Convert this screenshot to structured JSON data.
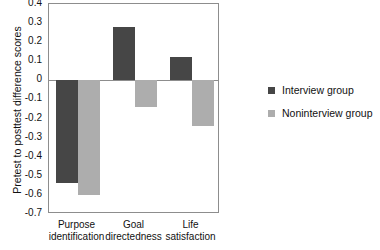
{
  "chart_data": {
    "type": "bar",
    "title": "",
    "xlabel": "",
    "ylabel": "Pretest to posttest difference scores",
    "categories": [
      "Purpose identification",
      "Goal directedness",
      "Life satisfaction"
    ],
    "category_lines": [
      [
        "Purpose",
        "identification"
      ],
      [
        "Goal",
        "directedness"
      ],
      [
        "Life",
        "satisfaction"
      ]
    ],
    "series": [
      {
        "name": "Interview group",
        "color": "#464646",
        "values": [
          -0.54,
          0.28,
          0.12
        ]
      },
      {
        "name": "Noninterview group",
        "color": "#ADADAD",
        "values": [
          -0.6,
          -0.14,
          -0.24
        ]
      }
    ],
    "ylim": [
      -0.7,
      0.4
    ],
    "yticks": [
      "0.4",
      "0.3",
      "0.2",
      "0.1",
      "0",
      "-0.1",
      "-0.2",
      "-0.3",
      "-0.4",
      "-0.5",
      "-0.6",
      "-0.7"
    ],
    "ytick_values": [
      0.4,
      0.3,
      0.2,
      0.1,
      0,
      -0.1,
      -0.2,
      -0.3,
      -0.4,
      -0.5,
      -0.6,
      -0.7
    ],
    "grid": false,
    "legend_position": "right",
    "zero_reference": 0
  }
}
